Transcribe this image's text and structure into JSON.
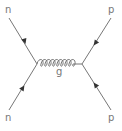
{
  "diagram": {
    "type": "feynman",
    "colors": {
      "line": "#777777",
      "label": "#777777",
      "background": "#ffffff"
    },
    "particles": {
      "top_left": {
        "label": "n",
        "arrow": "toward-vertex"
      },
      "bottom_left": {
        "label": "n",
        "arrow": "toward-vertex"
      },
      "top_right": {
        "label": "p",
        "arrow": "toward-vertex"
      },
      "bottom_right": {
        "label": "p",
        "arrow": "toward-vertex"
      }
    },
    "propagator": {
      "label": "g",
      "style": "gluon-coil",
      "coils": 9
    }
  }
}
